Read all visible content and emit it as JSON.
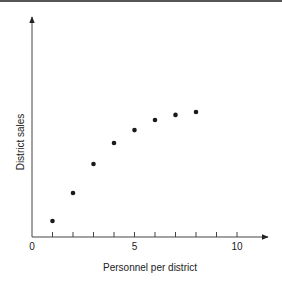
{
  "chart_data": {
    "type": "scatter",
    "title": "",
    "xlabel": "Personnel per district",
    "ylabel": "District sales",
    "x_ticks": [
      0,
      1,
      2,
      3,
      4,
      5,
      6,
      7,
      8,
      9,
      10
    ],
    "x_tick_labels": [
      "0",
      "5",
      "10"
    ],
    "xlim": [
      0,
      11.5
    ],
    "y_ticks_labeled": false,
    "ylim": [
      0,
      100
    ],
    "grid": false,
    "legend": null,
    "series": [
      {
        "name": "District sales",
        "x": [
          1,
          2,
          3,
          4,
          5,
          6,
          7,
          8
        ],
        "y": [
          7.3,
          20,
          33.2,
          42.7,
          48.6,
          53.2,
          55.5,
          56.8
        ]
      }
    ]
  },
  "labels": {
    "x_axis": "Personnel per district",
    "y_axis": "District sales",
    "tick_0": "0",
    "tick_5": "5",
    "tick_10": "10"
  }
}
